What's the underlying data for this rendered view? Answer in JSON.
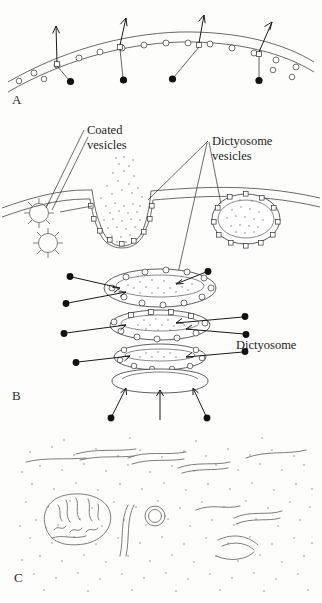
{
  "figure": {
    "background_color": "#fdfdfb",
    "ink_color": "#2b2b2b",
    "panels": [
      {
        "id": "A",
        "letter": "A",
        "description": "Cell membrane in surface view with membrane particles and arrows indicating outward movement"
      },
      {
        "id": "B",
        "letter": "B",
        "description": "Coated vesicles forming at plasma membrane and dictyosome cisternae with vesicles"
      },
      {
        "id": "C",
        "letter": "C",
        "description": "Stippled cytoplasm with mitochondrion, vesicle and endoplasmic reticulum profiles"
      }
    ],
    "labels": [
      {
        "id": "coated-vesicles",
        "line1": "Coated",
        "line2": "vesicles"
      },
      {
        "id": "dictyosome-vesicles",
        "line1": "Dictyosome",
        "line2": "vesicles"
      },
      {
        "id": "dictyosome",
        "line1": "Dictyosome",
        "line2": ""
      }
    ]
  }
}
